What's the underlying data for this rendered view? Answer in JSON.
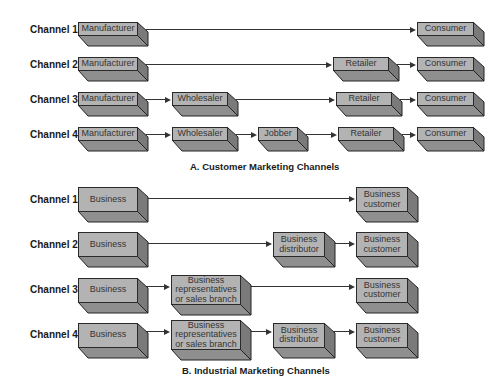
{
  "section_a": {
    "caption": "A. Customer Marketing Channels",
    "channels": [
      {
        "label": "Channel 1",
        "nodes": [
          "Manufacturer",
          "Consumer"
        ]
      },
      {
        "label": "Channel 2",
        "nodes": [
          "Manufacturer",
          "Retailer",
          "Consumer"
        ]
      },
      {
        "label": "Channel 3",
        "nodes": [
          "Manufacturer",
          "Wholesaler",
          "Retailer",
          "Consumer"
        ]
      },
      {
        "label": "Channel 4",
        "nodes": [
          "Manufacturer",
          "Wholesaler",
          "Jobber",
          "Retailer",
          "Consumer"
        ]
      }
    ]
  },
  "section_b": {
    "caption": "B. Industrial Marketing Channels",
    "channels": [
      {
        "label": "Channel 1",
        "nodes": [
          "Business",
          "Business customer"
        ]
      },
      {
        "label": "Channel 2",
        "nodes": [
          "Business",
          "Business distributor",
          "Business customer"
        ]
      },
      {
        "label": "Channel 3",
        "nodes": [
          "Business",
          "Business representatives or sales branch",
          "Business customer"
        ]
      },
      {
        "label": "Channel 4",
        "nodes": [
          "Business",
          "Business representatives or sales branch",
          "Business distributor",
          "Business customer"
        ]
      }
    ]
  },
  "colors": {
    "box_front": "#b3b3b3",
    "box_top": "#8f8f8f",
    "box_side": "#7a7a7a",
    "line": "#333333"
  }
}
